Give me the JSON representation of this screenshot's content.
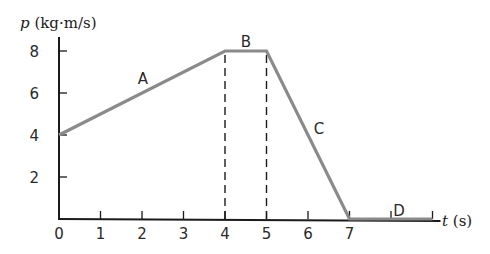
{
  "chart_data": {
    "type": "line",
    "title": "",
    "xlabel": "t (s)",
    "ylabel": "p (kg·m/s)",
    "xlabel_var": "t",
    "xlabel_unit": "(s)",
    "ylabel_var": "p",
    "ylabel_unit": "(kg·m/s)",
    "xlim": [
      0,
      9
    ],
    "ylim": [
      0,
      8
    ],
    "x_ticks": [
      0,
      1,
      2,
      3,
      4,
      5,
      6,
      7,
      8,
      9
    ],
    "x_tick_labels": [
      "0",
      "1",
      "2",
      "3",
      "4",
      "5",
      "6",
      "7",
      "",
      ""
    ],
    "y_ticks": [
      2,
      4,
      6,
      8
    ],
    "y_tick_labels": [
      "2",
      "4",
      "6",
      "8"
    ],
    "grid": false,
    "legend": null,
    "series": [
      {
        "name": "momentum",
        "x": [
          0,
          4,
          5,
          7,
          9
        ],
        "y": [
          4,
          8,
          8,
          0,
          0
        ]
      }
    ],
    "segments": [
      {
        "label": "A",
        "from": [
          0,
          4
        ],
        "to": [
          4,
          8
        ]
      },
      {
        "label": "B",
        "from": [
          4,
          8
        ],
        "to": [
          5,
          8
        ]
      },
      {
        "label": "C",
        "from": [
          5,
          8
        ],
        "to": [
          7,
          0
        ]
      },
      {
        "label": "D",
        "from": [
          7,
          0
        ],
        "to": [
          9,
          0
        ]
      }
    ],
    "guides": [
      {
        "type": "dashed-vertical",
        "x": 4,
        "y_from": 0,
        "y_to": 8
      },
      {
        "type": "dashed-vertical",
        "x": 5,
        "y_from": 0,
        "y_to": 8
      }
    ],
    "colors": {
      "line": "#8a8a8a",
      "axis": "#1a1a1a",
      "dash": "#1a1a1a"
    }
  }
}
